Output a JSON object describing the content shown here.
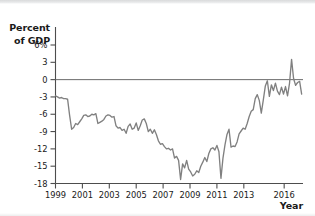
{
  "chart_data": {
    "type": "line",
    "title": "",
    "subtitle": "",
    "ylabel": "Percent of GDP",
    "ylabel_line1": "Percent",
    "ylabel_line2": "of GDP",
    "xlabel": "Year",
    "ylim": [
      -18,
      6
    ],
    "xlim": [
      1999.0,
      2017.4
    ],
    "grid": false,
    "legend": null,
    "zero_line": true,
    "line_color": "#808080",
    "axis_color": "#4d4d4d",
    "ytick_values": [
      6,
      3,
      0,
      -3,
      -6,
      -9,
      -12,
      -15,
      -18
    ],
    "ytick_labels": [
      "6%",
      "3",
      "0",
      "-3",
      "-6",
      "-9",
      "-12",
      "-15",
      "-18"
    ],
    "xtick_values": [
      1999,
      2001,
      2003,
      2005,
      2007,
      2009,
      2011,
      2013,
      2016
    ],
    "xtick_labels": [
      "1999",
      "2001",
      "2003",
      "2005",
      "2007",
      "2009",
      "2011",
      "2013",
      "2016"
    ],
    "series": [
      {
        "name": "Percent of GDP",
        "color": "#808080",
        "x": [
          1999.0,
          1999.15,
          1999.3,
          1999.45,
          1999.6,
          1999.75,
          1999.9,
          2000.05,
          2000.2,
          2000.35,
          2000.5,
          2000.65,
          2000.8,
          2000.95,
          2001.1,
          2001.25,
          2001.4,
          2001.55,
          2001.7,
          2001.85,
          2002.0,
          2002.15,
          2002.3,
          2002.45,
          2002.6,
          2002.75,
          2002.9,
          2003.05,
          2003.2,
          2003.35,
          2003.5,
          2003.65,
          2003.8,
          2003.95,
          2004.1,
          2004.25,
          2004.4,
          2004.55,
          2004.7,
          2004.85,
          2005.0,
          2005.15,
          2005.3,
          2005.45,
          2005.6,
          2005.75,
          2005.9,
          2006.05,
          2006.2,
          2006.35,
          2006.5,
          2006.65,
          2006.8,
          2006.95,
          2007.1,
          2007.25,
          2007.4,
          2007.55,
          2007.7,
          2007.85,
          2008.0,
          2008.15,
          2008.3,
          2008.45,
          2008.6,
          2008.75,
          2008.9,
          2009.05,
          2009.2,
          2009.35,
          2009.5,
          2009.65,
          2009.8,
          2009.95,
          2010.1,
          2010.25,
          2010.4,
          2010.55,
          2010.7,
          2010.85,
          2011.0,
          2011.15,
          2011.3,
          2011.45,
          2011.6,
          2011.75,
          2011.9,
          2012.05,
          2012.2,
          2012.35,
          2012.5,
          2012.65,
          2012.8,
          2012.95,
          2013.1,
          2013.25,
          2013.4,
          2013.55,
          2013.7,
          2013.85,
          2014.0,
          2014.15,
          2014.3,
          2014.45,
          2014.6,
          2014.75,
          2014.9,
          2015.05,
          2015.2,
          2015.35,
          2015.5,
          2015.65,
          2015.8,
          2015.95,
          2016.1,
          2016.25,
          2016.4,
          2016.55,
          2016.7,
          2016.85,
          2017.0,
          2017.15,
          2017.3
        ],
        "values": [
          -2.8,
          -3.0,
          -3.2,
          -3.1,
          -3.3,
          -3.3,
          -3.4,
          -6.2,
          -8.6,
          -8.3,
          -7.6,
          -7.8,
          -7.3,
          -6.8,
          -6.2,
          -6.1,
          -6.4,
          -6.3,
          -6.0,
          -6.1,
          -5.9,
          -7.6,
          -7.4,
          -7.2,
          -6.9,
          -6.3,
          -6.1,
          -6.2,
          -6.5,
          -6.4,
          -8.0,
          -8.4,
          -8.3,
          -8.8,
          -8.6,
          -9.3,
          -8.1,
          -7.7,
          -8.6,
          -8.4,
          -7.5,
          -8.8,
          -8.0,
          -7.0,
          -6.8,
          -7.6,
          -9.0,
          -8.6,
          -9.3,
          -8.7,
          -9.5,
          -10.6,
          -11.2,
          -11.1,
          -11.6,
          -12.0,
          -11.9,
          -12.2,
          -12.0,
          -13.6,
          -13.3,
          -14.0,
          -17.3,
          -14.6,
          -15.3,
          -14.0,
          -15.5,
          -16.0,
          -16.7,
          -16.4,
          -15.8,
          -16.1,
          -15.0,
          -14.3,
          -13.5,
          -14.2,
          -12.8,
          -12.0,
          -11.8,
          -12.2,
          -11.4,
          -12.5,
          -17.1,
          -13.6,
          -11.3,
          -9.5,
          -8.6,
          -11.7,
          -11.5,
          -11.6,
          -10.8,
          -9.4,
          -8.9,
          -8.4,
          -8.6,
          -7.6,
          -6.4,
          -5.5,
          -5.2,
          -3.3,
          -2.6,
          -3.6,
          -5.8,
          -3.5,
          -1.1,
          -0.2,
          -2.9,
          -0.9,
          -1.9,
          -0.6,
          -2.0,
          -2.6,
          -1.3,
          -2.5,
          -1.2,
          -2.8,
          -0.6,
          3.5,
          0.2,
          -1.0,
          -0.5,
          -0.3,
          -2.5
        ]
      }
    ]
  }
}
